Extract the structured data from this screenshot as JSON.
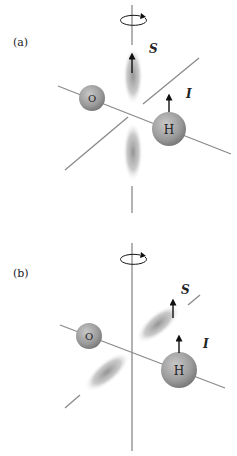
{
  "panels": [
    {
      "label": "(a)",
      "spin_label": "S",
      "nuclear_label": "I",
      "atoms": [
        {
          "symbol": "O"
        },
        {
          "symbol": "H"
        }
      ],
      "description": "Electron spin S aligned along rotation axis; lobes along vertical axis"
    },
    {
      "label": "(b)",
      "spin_label": "S",
      "nuclear_label": "I",
      "atoms": [
        {
          "symbol": "O"
        },
        {
          "symbol": "H"
        }
      ],
      "description": "Lobes along tilted axis; spin S parallel to nuclear spin I"
    }
  ],
  "colors": {
    "axis": "#8a8a8a",
    "atom_fill": "#9a9a9a",
    "lobe": "#9c9c9c",
    "arrow": "#111111"
  }
}
